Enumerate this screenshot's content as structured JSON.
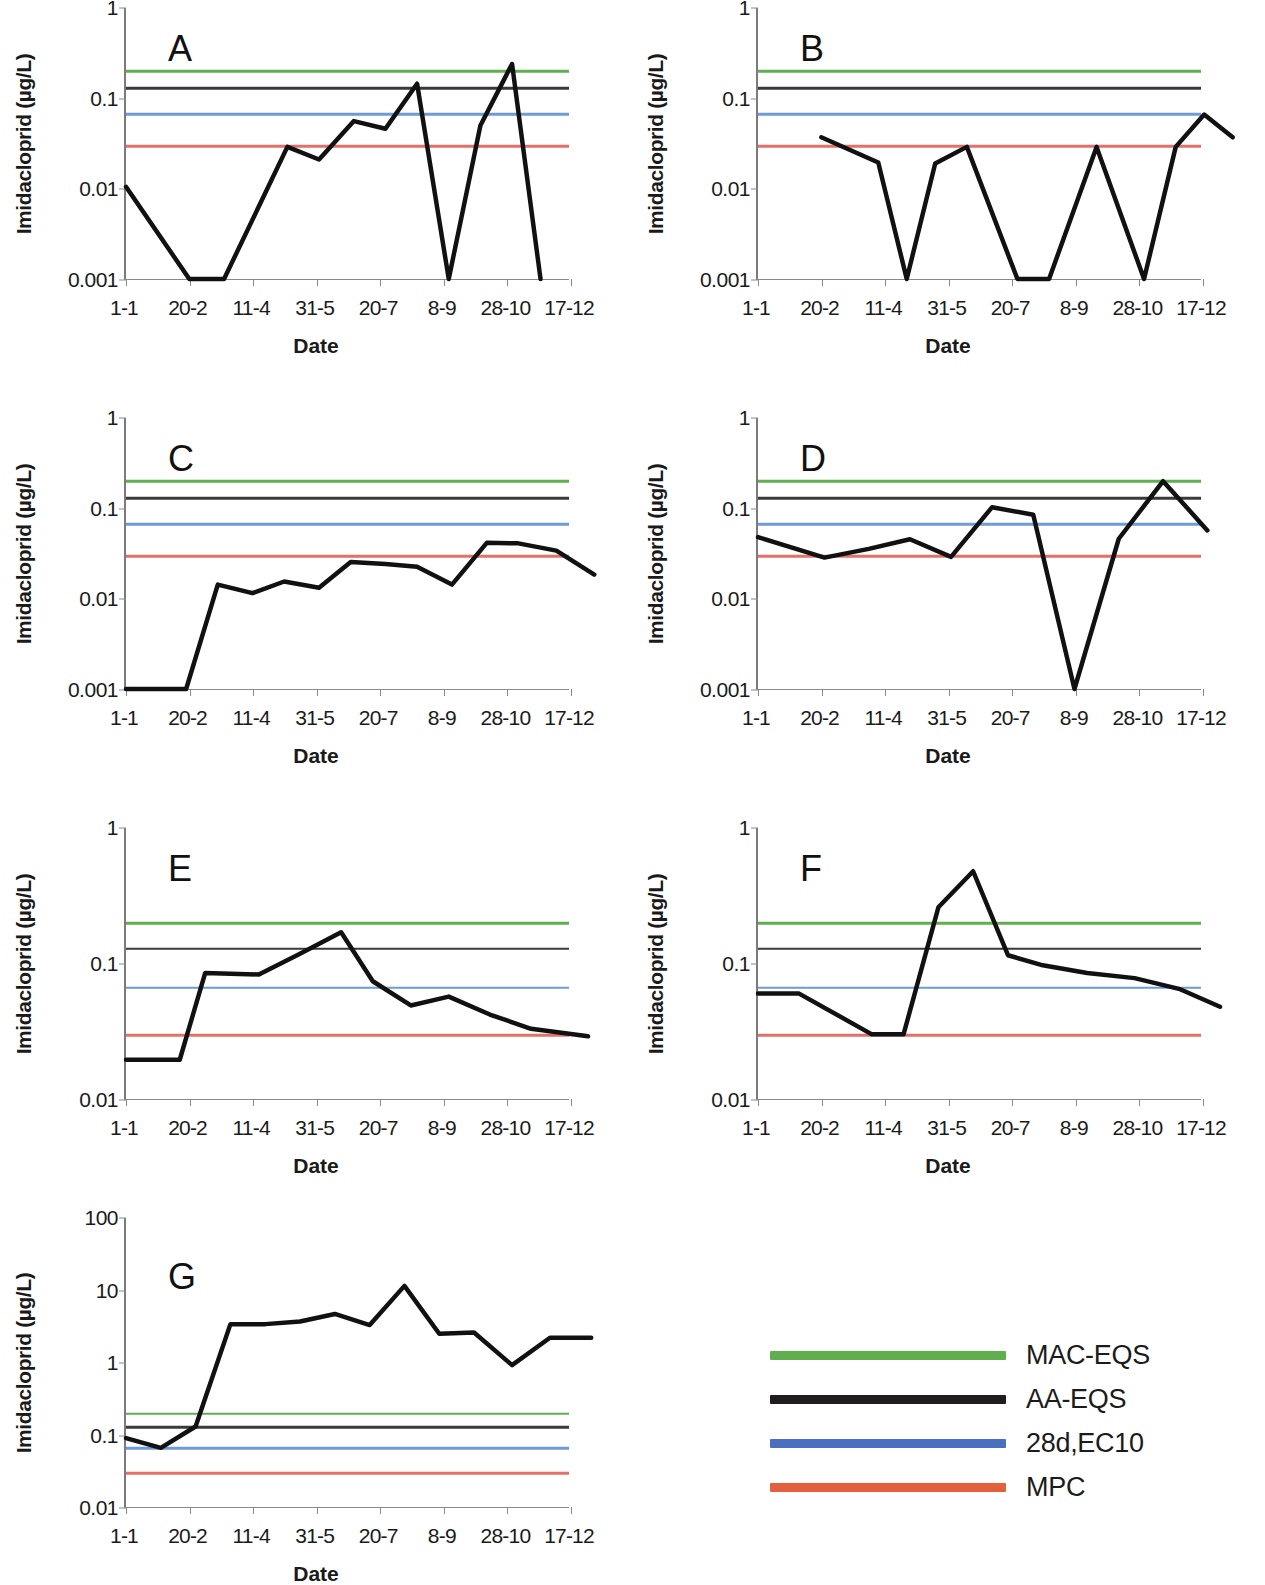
{
  "figure": {
    "ylabel": "Imidacloprid (µg/L)",
    "xlabel": "Date",
    "x_categories": [
      "1-1",
      "20-2",
      "11-4",
      "31-5",
      "20-7",
      "8-9",
      "28-10",
      "17-12"
    ]
  },
  "legend": {
    "items": [
      {
        "label": "MAC-EQS",
        "color": "#5FAF4E"
      },
      {
        "label": "AA-EQS",
        "color": "#201D1E"
      },
      {
        "label": "28d,EC10",
        "color": "#4A6FC0"
      },
      {
        "label": "MPC",
        "color": "#E3603C"
      }
    ]
  },
  "reference_lines": {
    "MAC-EQS": 0.2,
    "AA-EQS": 0.13,
    "28d,EC10": 0.067,
    "MPC": 0.03
  },
  "chart_data": [
    {
      "type": "line",
      "panel": "A",
      "title": "A",
      "xlabel": "Date",
      "ylabel": "Imidacloprid (µg/L)",
      "yscale": "log",
      "ylim": [
        0.001,
        1
      ],
      "yticks": [
        0.001,
        0.01,
        0.1,
        1
      ],
      "ytick_labels": [
        "0.001",
        "0.01",
        "0.1",
        "1"
      ],
      "xtick_labels": [
        "1-1",
        "20-2",
        "11-4",
        "31-5",
        "20-7",
        "8-9",
        "28-10",
        "17-12"
      ],
      "grid": false,
      "legend_position": "external-bottom-right",
      "series": [
        {
          "name": "Imidacloprid",
          "color": "#111111",
          "x": [
            0.0,
            1.0,
            1.55,
            2.55,
            3.05,
            3.6,
            4.1,
            4.6,
            5.1,
            5.6,
            6.1,
            6.55,
            7.1,
            7.6
          ],
          "values": [
            0.0105,
            0.001,
            0.001,
            0.029,
            0.021,
            0.056,
            0.046,
            0.145,
            0.001,
            0.05,
            0.24,
            0.001,
            null,
            null
          ]
        }
      ],
      "reference_lines": [
        {
          "name": "MAC-EQS",
          "value": 0.2,
          "color": "#5FAF4E"
        },
        {
          "name": "AA-EQS",
          "value": 0.13,
          "color": "#3A3A3A"
        },
        {
          "name": "28d,EC10",
          "value": 0.067,
          "color": "#6E9BD8"
        },
        {
          "name": "MPC",
          "value": 0.03,
          "color": "#E3716A"
        }
      ]
    },
    {
      "type": "line",
      "panel": "B",
      "title": "B",
      "xlabel": "Date",
      "ylabel": "Imidacloprid (µg/L)",
      "yscale": "log",
      "ylim": [
        0.001,
        1
      ],
      "yticks": [
        0.001,
        0.01,
        0.1,
        1
      ],
      "ytick_labels": [
        "0.001",
        "0.01",
        "0.1",
        "1"
      ],
      "xtick_labels": [
        "1-1",
        "20-2",
        "11-4",
        "31-5",
        "20-7",
        "8-9",
        "28-10",
        "17-12"
      ],
      "grid": false,
      "legend_position": "external-bottom-right",
      "series": [
        {
          "name": "Imidacloprid",
          "color": "#111111",
          "x": [
            1.0,
            1.9,
            2.35,
            2.8,
            3.3,
            4.1,
            4.6,
            5.35,
            6.1,
            6.6,
            7.05,
            7.5
          ],
          "values": [
            0.037,
            0.0195,
            0.001,
            0.019,
            0.029,
            0.001,
            0.001,
            0.029,
            0.001,
            0.029,
            0.066,
            0.037
          ]
        }
      ],
      "reference_lines": [
        {
          "name": "MAC-EQS",
          "value": 0.2,
          "color": "#5FAF4E"
        },
        {
          "name": "AA-EQS",
          "value": 0.13,
          "color": "#3A3A3A"
        },
        {
          "name": "28d,EC10",
          "value": 0.067,
          "color": "#6E9BD8"
        },
        {
          "name": "MPC",
          "value": 0.03,
          "color": "#E3716A"
        }
      ]
    },
    {
      "type": "line",
      "panel": "C",
      "title": "C",
      "xlabel": "Date",
      "ylabel": "Imidacloprid (µg/L)",
      "yscale": "log",
      "ylim": [
        0.001,
        1
      ],
      "yticks": [
        0.001,
        0.01,
        0.1,
        1
      ],
      "ytick_labels": [
        "0.001",
        "0.01",
        "0.1",
        "1"
      ],
      "xtick_labels": [
        "1-1",
        "20-2",
        "11-4",
        "31-5",
        "20-7",
        "8-9",
        "28-10",
        "17-12"
      ],
      "grid": false,
      "legend_position": "external-bottom-right",
      "series": [
        {
          "name": "Imidacloprid",
          "color": "#111111",
          "x": [
            0.0,
            0.95,
            1.45,
            2.0,
            2.5,
            3.05,
            3.55,
            4.1,
            4.6,
            5.15,
            5.7,
            6.2,
            6.8,
            7.4
          ],
          "values": [
            0.001,
            0.001,
            0.0143,
            0.0115,
            0.0155,
            0.0132,
            0.0255,
            0.0242,
            0.0225,
            0.0143,
            0.0415,
            0.041,
            0.034,
            0.0185
          ]
        }
      ],
      "reference_lines": [
        {
          "name": "MAC-EQS",
          "value": 0.2,
          "color": "#5FAF4E"
        },
        {
          "name": "AA-EQS",
          "value": 0.13,
          "color": "#3A3A3A"
        },
        {
          "name": "28d,EC10",
          "value": 0.067,
          "color": "#6E9BD8"
        },
        {
          "name": "MPC",
          "value": 0.03,
          "color": "#E3716A"
        }
      ]
    },
    {
      "type": "line",
      "panel": "D",
      "title": "D",
      "xlabel": "Date",
      "ylabel": "Imidacloprid (µg/L)",
      "yscale": "log",
      "ylim": [
        0.001,
        1
      ],
      "yticks": [
        0.001,
        0.01,
        0.1,
        1
      ],
      "ytick_labels": [
        "0.001",
        "0.01",
        "0.1",
        "1"
      ],
      "xtick_labels": [
        "1-1",
        "20-2",
        "11-4",
        "31-5",
        "20-7",
        "8-9",
        "28-10",
        "17-12"
      ],
      "grid": false,
      "legend_position": "external-bottom-right",
      "series": [
        {
          "name": "Imidacloprid",
          "color": "#111111",
          "x": [
            0.0,
            1.05,
            1.75,
            2.4,
            3.05,
            3.7,
            4.35,
            5.0,
            5.7,
            6.4,
            7.1
          ],
          "values": [
            0.048,
            0.0285,
            0.0355,
            0.0455,
            0.029,
            0.103,
            0.085,
            0.001,
            0.046,
            0.2,
            0.057
          ]
        }
      ],
      "reference_lines": [
        {
          "name": "MAC-EQS",
          "value": 0.2,
          "color": "#5FAF4E"
        },
        {
          "name": "AA-EQS",
          "value": 0.13,
          "color": "#3A3A3A"
        },
        {
          "name": "28d,EC10",
          "value": 0.067,
          "color": "#6E9BD8"
        },
        {
          "name": "MPC",
          "value": 0.03,
          "color": "#E3716A"
        }
      ]
    },
    {
      "type": "line",
      "panel": "E",
      "title": "E",
      "xlabel": "Date",
      "ylabel": "Imidacloprid (µg/L)",
      "yscale": "log",
      "ylim": [
        0.01,
        1
      ],
      "yticks": [
        0.01,
        0.1,
        1
      ],
      "ytick_labels": [
        "0.01",
        "0.1",
        "1"
      ],
      "xtick_labels": [
        "1-1",
        "20-2",
        "11-4",
        "31-5",
        "20-7",
        "8-9",
        "28-10",
        "17-12"
      ],
      "grid": false,
      "legend_position": "external-bottom-right",
      "series": [
        {
          "name": "Imidacloprid",
          "color": "#111111",
          "x": [
            0.0,
            0.85,
            1.25,
            2.1,
            2.75,
            3.4,
            3.9,
            4.5,
            5.1,
            5.75,
            6.4,
            7.3
          ],
          "values": [
            0.0195,
            0.0195,
            0.085,
            0.083,
            0.118,
            0.17,
            0.074,
            0.049,
            0.057,
            0.042,
            0.033,
            0.029
          ]
        }
      ],
      "reference_lines": [
        {
          "name": "MAC-EQS",
          "value": 0.2,
          "color": "#5FAF4E"
        },
        {
          "name": "AA-EQS",
          "value": 0.13,
          "color": "#3A3A3A"
        },
        {
          "name": "28d,EC10",
          "value": 0.067,
          "color": "#6E9BD8"
        },
        {
          "name": "MPC",
          "value": 0.03,
          "color": "#E3716A"
        }
      ]
    },
    {
      "type": "line",
      "panel": "F",
      "title": "F",
      "xlabel": "Date",
      "ylabel": "Imidacloprid (µg/L)",
      "yscale": "log",
      "ylim": [
        0.01,
        1
      ],
      "yticks": [
        0.01,
        0.1,
        1
      ],
      "ytick_labels": [
        "0.01",
        "0.1",
        "1"
      ],
      "xtick_labels": [
        "1-1",
        "20-2",
        "11-4",
        "31-5",
        "20-7",
        "8-9",
        "28-10",
        "17-12"
      ],
      "grid": false,
      "legend_position": "external-bottom-right",
      "series": [
        {
          "name": "Imidacloprid",
          "color": "#111111",
          "x": [
            0.0,
            0.65,
            1.8,
            2.3,
            2.85,
            3.4,
            3.95,
            4.5,
            5.2,
            5.95,
            6.65,
            7.3
          ],
          "values": [
            0.06,
            0.06,
            0.03,
            0.03,
            0.26,
            0.48,
            0.115,
            0.097,
            0.085,
            0.078,
            0.065,
            0.048
          ]
        }
      ],
      "reference_lines": [
        {
          "name": "MAC-EQS",
          "value": 0.2,
          "color": "#5FAF4E"
        },
        {
          "name": "AA-EQS",
          "value": 0.13,
          "color": "#3A3A3A"
        },
        {
          "name": "28d,EC10",
          "value": 0.067,
          "color": "#6E9BD8"
        },
        {
          "name": "MPC",
          "value": 0.03,
          "color": "#E3716A"
        }
      ]
    },
    {
      "type": "line",
      "panel": "G",
      "title": "G",
      "xlabel": "Date",
      "ylabel": "Imidacloprid (µg/L)",
      "yscale": "log",
      "ylim": [
        0.01,
        100
      ],
      "yticks": [
        0.01,
        0.1,
        1,
        10,
        100
      ],
      "ytick_labels": [
        "0.01",
        "0.1",
        "1",
        "10",
        "100"
      ],
      "xtick_labels": [
        "1-1",
        "20-2",
        "11-4",
        "31-5",
        "20-7",
        "8-9",
        "28-10",
        "17-12"
      ],
      "grid": false,
      "legend_position": "external-bottom-right",
      "series": [
        {
          "name": "Imidacloprid",
          "color": "#111111",
          "x": [
            0.0,
            0.55,
            1.1,
            1.65,
            2.2,
            2.75,
            3.3,
            3.85,
            4.4,
            4.95,
            5.5,
            6.1,
            6.7,
            7.35
          ],
          "values": [
            0.09,
            0.066,
            0.13,
            3.4,
            3.4,
            3.7,
            4.7,
            3.3,
            11.5,
            2.5,
            2.6,
            0.92,
            2.2,
            2.2
          ]
        }
      ],
      "reference_lines": [
        {
          "name": "MAC-EQS",
          "value": 0.2,
          "color": "#5FAF4E"
        },
        {
          "name": "AA-EQS",
          "value": 0.13,
          "color": "#3A3A3A"
        },
        {
          "name": "28d,EC10",
          "value": 0.067,
          "color": "#6E9BD8"
        },
        {
          "name": "MPC",
          "value": 0.03,
          "color": "#E3716A"
        }
      ]
    }
  ]
}
